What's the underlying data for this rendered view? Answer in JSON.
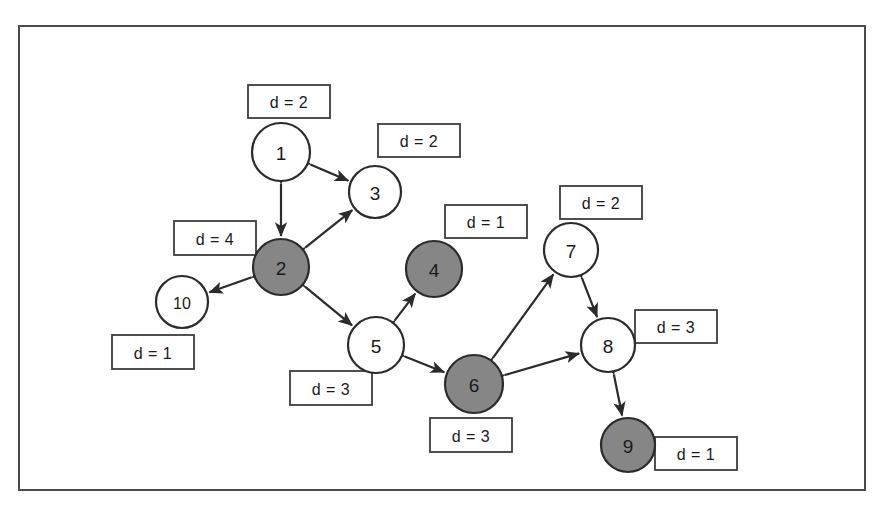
{
  "diagram": {
    "canvas": {
      "width": 885,
      "height": 506
    },
    "frame": {
      "x": 18,
      "y": 25,
      "width": 848,
      "height": 466,
      "stroke": "#4a4a4a"
    },
    "colors": {
      "node_white": "#ffffff",
      "node_gray": "#868686",
      "node_stroke": "#2b2b2b",
      "edge": "#2b2b2b",
      "box_stroke": "#3d3d3d",
      "background": "#ffffff"
    },
    "nodes": [
      {
        "id": "1",
        "label": "1",
        "x": 281,
        "y": 152,
        "r": 29,
        "fill": "white",
        "degree_label": "d = 2",
        "box": {
          "x": 248,
          "y": 85,
          "w": 82,
          "h": 33
        }
      },
      {
        "id": "2",
        "label": "2",
        "x": 281,
        "y": 267,
        "r": 28,
        "fill": "gray",
        "degree_label": "d = 4",
        "box": {
          "x": 174,
          "y": 221,
          "w": 82,
          "h": 34
        }
      },
      {
        "id": "3",
        "label": "3",
        "x": 375,
        "y": 192,
        "r": 26,
        "fill": "white",
        "degree_label": "d = 2",
        "box": {
          "x": 378,
          "y": 124,
          "w": 82,
          "h": 33
        }
      },
      {
        "id": "4",
        "label": "4",
        "x": 434,
        "y": 269,
        "r": 28,
        "fill": "gray",
        "degree_label": "d = 1",
        "box": {
          "x": 445,
          "y": 205,
          "w": 82,
          "h": 33
        }
      },
      {
        "id": "5",
        "label": "5",
        "x": 376,
        "y": 345,
        "r": 28,
        "fill": "white",
        "degree_label": "d = 3",
        "box": {
          "x": 290,
          "y": 371,
          "w": 82,
          "h": 34
        }
      },
      {
        "id": "6",
        "label": "6",
        "x": 474,
        "y": 384,
        "r": 29,
        "fill": "gray",
        "degree_label": "d = 3",
        "box": {
          "x": 430,
          "y": 418,
          "w": 82,
          "h": 34
        }
      },
      {
        "id": "7",
        "label": "7",
        "x": 571,
        "y": 250,
        "r": 27,
        "fill": "white",
        "degree_label": "d = 2",
        "box": {
          "x": 560,
          "y": 186,
          "w": 82,
          "h": 33
        }
      },
      {
        "id": "8",
        "label": "8",
        "x": 608,
        "y": 345,
        "r": 27,
        "fill": "white",
        "degree_label": "d = 3",
        "box": {
          "x": 635,
          "y": 310,
          "w": 82,
          "h": 33
        }
      },
      {
        "id": "9",
        "label": "9",
        "x": 628,
        "y": 445,
        "r": 27,
        "fill": "gray",
        "degree_label": "d = 1",
        "box": {
          "x": 655,
          "y": 437,
          "w": 82,
          "h": 33
        }
      },
      {
        "id": "10",
        "label": "10",
        "x": 182,
        "y": 302,
        "r": 26,
        "fill": "white",
        "degree_label": "d = 1",
        "box": {
          "x": 112,
          "y": 335,
          "w": 82,
          "h": 34
        }
      }
    ],
    "edges": [
      {
        "from": "1",
        "to": "2",
        "arrows": "both"
      },
      {
        "from": "1",
        "to": "3",
        "arrows": "both"
      },
      {
        "from": "2",
        "to": "3",
        "arrows": "both"
      },
      {
        "from": "2",
        "to": "10",
        "arrows": "both"
      },
      {
        "from": "2",
        "to": "5",
        "arrows": "both"
      },
      {
        "from": "5",
        "to": "4",
        "arrows": "both"
      },
      {
        "from": "5",
        "to": "6",
        "arrows": "both"
      },
      {
        "from": "6",
        "to": "7",
        "arrows": "both"
      },
      {
        "from": "6",
        "to": "8",
        "arrows": "both"
      },
      {
        "from": "7",
        "to": "8",
        "arrows": "both"
      },
      {
        "from": "8",
        "to": "9",
        "arrows": "both"
      }
    ]
  }
}
